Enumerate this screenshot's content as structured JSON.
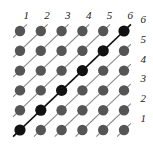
{
  "figure": {
    "type": "lattice-diagram",
    "title": "",
    "grid": {
      "rows": 6,
      "cols": 6,
      "origin_x": 20,
      "origin_y": 31,
      "dx": 20.8,
      "dy": 19.8,
      "node_radius": 5.2,
      "highlight_node_radius": 5.6
    },
    "colors": {
      "background": "#ffffff",
      "node_normal": "#555555",
      "node_highlight": "#111111",
      "line_normal": "#8a8a8a",
      "line_highlight": "#111111",
      "label": "#1a1a1a"
    },
    "line": {
      "direction": "lower-left to upper-right",
      "normal_width": 1.1,
      "highlight_width": 1.6,
      "stub_length": 9.5
    },
    "top_labels": [
      "1",
      "2",
      "3",
      "4",
      "5",
      "6"
    ],
    "right_labels": [
      "6",
      "5",
      "4",
      "3",
      "2",
      "1"
    ],
    "highlight_description": "anti-diagonal",
    "nodes": [
      {
        "row": 1,
        "col": 1,
        "highlight": false
      },
      {
        "row": 1,
        "col": 2,
        "highlight": false
      },
      {
        "row": 1,
        "col": 3,
        "highlight": false
      },
      {
        "row": 1,
        "col": 4,
        "highlight": false
      },
      {
        "row": 1,
        "col": 5,
        "highlight": false
      },
      {
        "row": 1,
        "col": 6,
        "highlight": true
      },
      {
        "row": 2,
        "col": 1,
        "highlight": false
      },
      {
        "row": 2,
        "col": 2,
        "highlight": false
      },
      {
        "row": 2,
        "col": 3,
        "highlight": false
      },
      {
        "row": 2,
        "col": 4,
        "highlight": false
      },
      {
        "row": 2,
        "col": 5,
        "highlight": true
      },
      {
        "row": 2,
        "col": 6,
        "highlight": false
      },
      {
        "row": 3,
        "col": 1,
        "highlight": false
      },
      {
        "row": 3,
        "col": 2,
        "highlight": false
      },
      {
        "row": 3,
        "col": 3,
        "highlight": false
      },
      {
        "row": 3,
        "col": 4,
        "highlight": true
      },
      {
        "row": 3,
        "col": 5,
        "highlight": false
      },
      {
        "row": 3,
        "col": 6,
        "highlight": false
      },
      {
        "row": 4,
        "col": 1,
        "highlight": false
      },
      {
        "row": 4,
        "col": 2,
        "highlight": false
      },
      {
        "row": 4,
        "col": 3,
        "highlight": true
      },
      {
        "row": 4,
        "col": 4,
        "highlight": false
      },
      {
        "row": 4,
        "col": 5,
        "highlight": false
      },
      {
        "row": 4,
        "col": 6,
        "highlight": false
      },
      {
        "row": 5,
        "col": 1,
        "highlight": false
      },
      {
        "row": 5,
        "col": 2,
        "highlight": true
      },
      {
        "row": 5,
        "col": 3,
        "highlight": false
      },
      {
        "row": 5,
        "col": 4,
        "highlight": false
      },
      {
        "row": 5,
        "col": 5,
        "highlight": false
      },
      {
        "row": 5,
        "col": 6,
        "highlight": false
      },
      {
        "row": 6,
        "col": 1,
        "highlight": true
      },
      {
        "row": 6,
        "col": 2,
        "highlight": false
      },
      {
        "row": 6,
        "col": 3,
        "highlight": false
      },
      {
        "row": 6,
        "col": 4,
        "highlight": false
      },
      {
        "row": 6,
        "col": 5,
        "highlight": false
      },
      {
        "row": 6,
        "col": 6,
        "highlight": false
      }
    ]
  }
}
